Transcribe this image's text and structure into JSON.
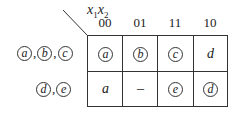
{
  "diagram": {
    "corner_label": {
      "var1": "x",
      "sub1": "1",
      "var2": "x",
      "sub2": "2"
    },
    "columns": [
      "00",
      "01",
      "11",
      "10"
    ],
    "rows": [
      {
        "label": [
          {
            "text": "a",
            "circled": true
          },
          {
            "text": "b",
            "circled": true
          },
          {
            "text": "c",
            "circled": true
          }
        ],
        "cells": [
          {
            "text": "a",
            "circled": true
          },
          {
            "text": "b",
            "circled": true
          },
          {
            "text": "c",
            "circled": true
          },
          {
            "text": "d",
            "circled": false
          }
        ]
      },
      {
        "label": [
          {
            "text": "d",
            "circled": true
          },
          {
            "text": "e",
            "circled": true
          }
        ],
        "cells": [
          {
            "text": "a",
            "circled": false
          },
          {
            "text": "–",
            "circled": false
          },
          {
            "text": "e",
            "circled": true
          },
          {
            "text": "d",
            "circled": true
          }
        ]
      }
    ],
    "separator": ","
  }
}
